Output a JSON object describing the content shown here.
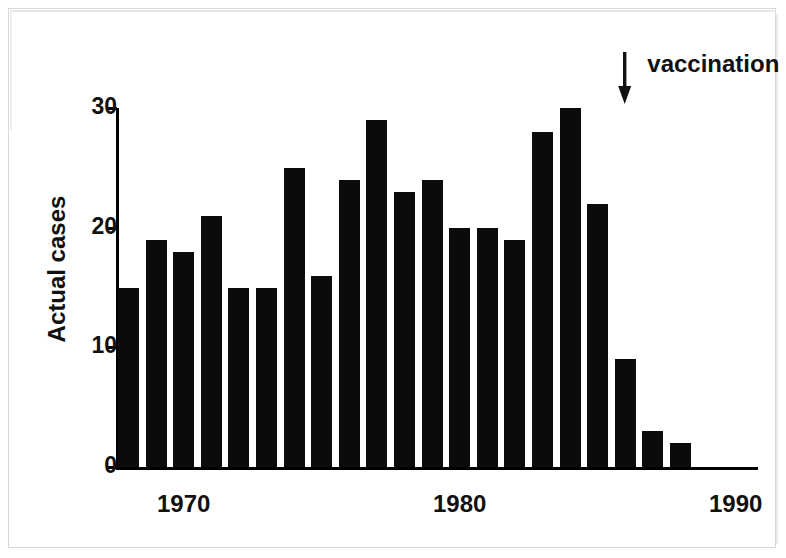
{
  "chart_data": {
    "type": "bar",
    "title": "",
    "subtitle": "",
    "xlabel": "",
    "ylabel": "Actual cases",
    "categories": [
      1968,
      1969,
      1970,
      1971,
      1972,
      1973,
      1974,
      1975,
      1976,
      1977,
      1978,
      1979,
      1980,
      1981,
      1982,
      1983,
      1984,
      1985,
      1986,
      1987,
      1988,
      1989,
      1990
    ],
    "values": [
      15,
      19,
      18,
      21,
      15,
      15,
      25,
      16,
      24,
      29,
      23,
      24,
      20,
      20,
      19,
      28,
      30,
      22,
      9,
      3,
      2,
      0,
      0
    ],
    "ylim": [
      0,
      30
    ],
    "xlim": [
      1967.5,
      1990.5
    ],
    "yticks": [
      0,
      10,
      20,
      30
    ],
    "ytick_labels": [
      "0",
      "10",
      "20",
      "30"
    ],
    "xticks": [
      1970,
      1980,
      1990
    ],
    "xtick_labels": [
      "1970",
      "1980",
      "1990"
    ],
    "grid": false,
    "legend": false,
    "bar_color": "#0b0b0b",
    "axis_color": "#000000",
    "annotations": [
      {
        "text": "vaccination",
        "points_to_category": 1986,
        "points_to_value": 30,
        "marker": "down-arrow"
      }
    ]
  },
  "annotation": {
    "label": "vaccination"
  },
  "axes": {
    "y_title": "Actual cases"
  }
}
